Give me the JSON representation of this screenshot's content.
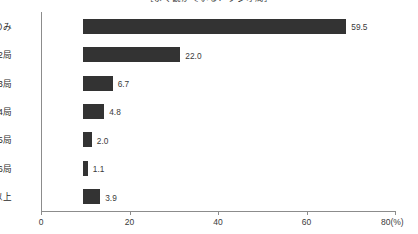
{
  "chart_data": {
    "type": "bar",
    "orientation": "horizontal",
    "title": "［よく観かている？ラジオ局］",
    "categories": [
      "1局のみ",
      "2局",
      "3局",
      "4局",
      "5局",
      "6局",
      "7局以上"
    ],
    "values": [
      59.5,
      22.0,
      6.7,
      4.8,
      2.0,
      1.1,
      3.9
    ],
    "value_labels": [
      "59.5",
      "22.0",
      "6.7",
      "4.8",
      "2.0",
      "1.1",
      "3.9"
    ],
    "xlabel": "",
    "ylabel": "",
    "xlim": [
      0,
      80
    ],
    "x_ticks": [
      0,
      20,
      40,
      60,
      80
    ],
    "x_tick_labels": [
      "0",
      "20",
      "40",
      "60",
      "80"
    ],
    "x_unit": "(%)",
    "x_axis_end_label": "80(%)",
    "grid": false,
    "legend": false,
    "bar_color": "#333333",
    "axis_color": "#8c8c8c",
    "text_color": "#2b2b2b"
  },
  "footnote": ""
}
